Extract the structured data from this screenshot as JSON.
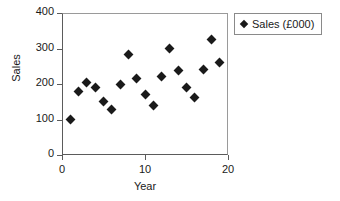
{
  "chart_data": {
    "type": "scatter",
    "title": "",
    "xlabel": "Year",
    "ylabel": "Sales",
    "xlim": [
      0,
      20
    ],
    "ylim": [
      0,
      400
    ],
    "xticks": [
      0,
      10,
      20
    ],
    "yticks": [
      0,
      100,
      200,
      300,
      400
    ],
    "xtick_labels": [
      "0",
      "10",
      "20"
    ],
    "ytick_labels": [
      "0",
      "100",
      "200",
      "300",
      "400"
    ],
    "grid": false,
    "legend_position": "right",
    "marker": "diamond",
    "marker_color": "#1a1a1a",
    "series": [
      {
        "name": "Sales (£000)",
        "x": [
          1,
          2,
          3,
          4,
          5,
          6,
          7,
          8,
          9,
          10,
          11,
          12,
          13,
          14,
          15,
          16,
          17,
          18,
          19
        ],
        "values": [
          101,
          180,
          203,
          190,
          152,
          128,
          199,
          283,
          215,
          170,
          140,
          220,
          299,
          238,
          190,
          163,
          242,
          326,
          261
        ]
      }
    ]
  },
  "legend": {
    "entries": [
      {
        "label": "Sales (£000)",
        "marker": "diamond-marker"
      }
    ]
  }
}
